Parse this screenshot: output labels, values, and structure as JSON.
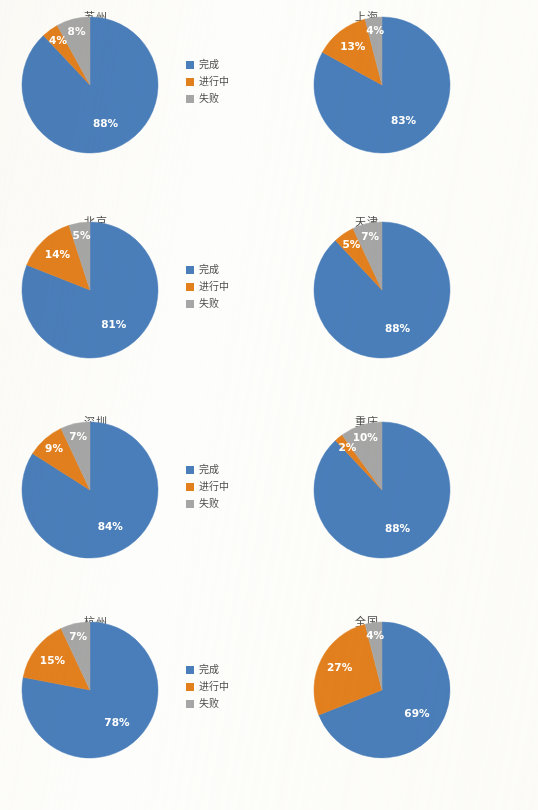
{
  "page": {
    "background_color": "#fdfdfb",
    "columns": 2,
    "rows": 4
  },
  "legend": {
    "items": [
      {
        "label": "完成",
        "color": "#4a7ebb",
        "icon": "legend-swatch-icon"
      },
      {
        "label": "进行中",
        "color": "#e2801e",
        "icon": "legend-swatch-icon"
      },
      {
        "label": "失败",
        "color": "#a6a6a6",
        "icon": "legend-swatch-icon"
      }
    ]
  },
  "chart_data": [
    {
      "type": "pie",
      "title": "苏州",
      "categories": [
        "完成",
        "进行中",
        "失败"
      ],
      "values": [
        88,
        4,
        8
      ],
      "labels": [
        "88%",
        "4%",
        "8%"
      ],
      "colors": [
        "#4a7ebb",
        "#e2801e",
        "#a6a6a6"
      ],
      "start_angle_deg": 0,
      "direction": "clockwise",
      "legend_position": "right"
    },
    {
      "type": "pie",
      "title": "上海",
      "categories": [
        "完成",
        "进行中",
        "失败"
      ],
      "values": [
        83,
        13,
        4
      ],
      "labels": [
        "83%",
        "13%",
        "4%"
      ],
      "colors": [
        "#4a7ebb",
        "#e2801e",
        "#a6a6a6"
      ],
      "start_angle_deg": 0,
      "direction": "clockwise",
      "legend_position": "right"
    },
    {
      "type": "pie",
      "title": "北京",
      "categories": [
        "完成",
        "进行中",
        "失败"
      ],
      "values": [
        81,
        14,
        5
      ],
      "labels": [
        "81%",
        "14%",
        "5%"
      ],
      "colors": [
        "#4a7ebb",
        "#e2801e",
        "#a6a6a6"
      ],
      "start_angle_deg": 0,
      "direction": "clockwise",
      "legend_position": "right"
    },
    {
      "type": "pie",
      "title": "天津",
      "categories": [
        "完成",
        "进行中",
        "失败"
      ],
      "values": [
        88,
        5,
        7
      ],
      "labels": [
        "88%",
        "5%",
        "7%"
      ],
      "colors": [
        "#4a7ebb",
        "#e2801e",
        "#a6a6a6"
      ],
      "start_angle_deg": 0,
      "direction": "clockwise",
      "legend_position": "right"
    },
    {
      "type": "pie",
      "title": "深圳",
      "categories": [
        "完成",
        "进行中",
        "失败"
      ],
      "values": [
        84,
        9,
        7
      ],
      "labels": [
        "84%",
        "9%",
        "7%"
      ],
      "colors": [
        "#4a7ebb",
        "#e2801e",
        "#a6a6a6"
      ],
      "start_angle_deg": 0,
      "direction": "clockwise",
      "legend_position": "right"
    },
    {
      "type": "pie",
      "title": "重庆",
      "categories": [
        "完成",
        "进行中",
        "失败"
      ],
      "values": [
        88,
        2,
        10
      ],
      "labels": [
        "88%",
        "2%",
        "10%"
      ],
      "colors": [
        "#4a7ebb",
        "#e2801e",
        "#a6a6a6"
      ],
      "start_angle_deg": 0,
      "direction": "clockwise",
      "legend_position": "right"
    },
    {
      "type": "pie",
      "title": "杭州",
      "categories": [
        "完成",
        "进行中",
        "失败"
      ],
      "values": [
        78,
        15,
        7
      ],
      "labels": [
        "78%",
        "15%",
        "7%"
      ],
      "colors": [
        "#4a7ebb",
        "#e2801e",
        "#a6a6a6"
      ],
      "start_angle_deg": 0,
      "direction": "clockwise",
      "legend_position": "right"
    },
    {
      "type": "pie",
      "title": "全国",
      "categories": [
        "完成",
        "进行中",
        "失败"
      ],
      "values": [
        69,
        27,
        4
      ],
      "labels": [
        "69%",
        "27%",
        "4%"
      ],
      "colors": [
        "#4a7ebb",
        "#e2801e",
        "#a6a6a6"
      ],
      "start_angle_deg": 0,
      "direction": "clockwise",
      "legend_position": "right"
    }
  ]
}
